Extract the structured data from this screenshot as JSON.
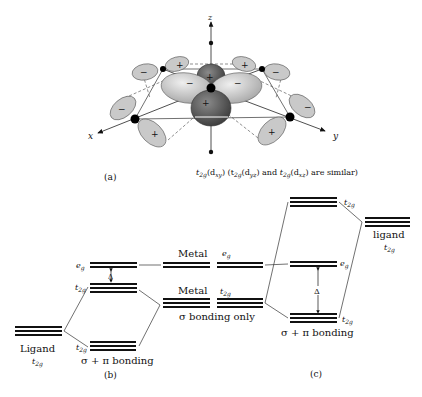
{
  "panel_a": {
    "label": "(a)",
    "caption": {
      "part1_main": "t",
      "part1_sub": "2g",
      "part1_orbital": "(d",
      "part1_orbital_sub": "xy",
      "part1_close": ")",
      "part2_open": "(t",
      "part2_sub": "2g",
      "part2_orbital": "(d",
      "part2_orbital_sub": "yz",
      "part2_close": ")",
      "and": "and",
      "part3_main": "t",
      "part3_sub": "2g",
      "part3_orbital": "(d",
      "part3_orbital_sub": "xz",
      "part3_tail": ") are similar)"
    },
    "axes": {
      "x": "x",
      "y": "y",
      "z": "z"
    },
    "signs": {
      "plus": "+",
      "minus": "−"
    }
  },
  "panel_b": {
    "label": "(b)",
    "ligand_label": "Ligand",
    "ligand_sym": "t",
    "ligand_sub": "2g",
    "eg_sym": "e",
    "eg_sub": "g",
    "t2g_sym": "t",
    "t2g_sub": "2g",
    "delta": "Δ",
    "bonding": "σ + π bonding"
  },
  "panel_middle": {
    "metal_top": "Metal",
    "metal_bottom": "Metal",
    "eg_sym": "e",
    "eg_sub": "g",
    "t2g_sym": "t",
    "t2g_sub": "2g",
    "sigma_only": "σ bonding only"
  },
  "panel_c": {
    "label": "(c)",
    "ligand_label": "ligand",
    "ligand_sym": "t",
    "ligand_sub": "2g",
    "t2g_upper_sym": "t",
    "t2g_upper_sub": "2g",
    "eg_sym": "e",
    "eg_sub": "g",
    "t2g_lower_sym": "t",
    "t2g_lower_sub": "2g",
    "delta": "Δ",
    "bonding": "σ + π bonding"
  }
}
